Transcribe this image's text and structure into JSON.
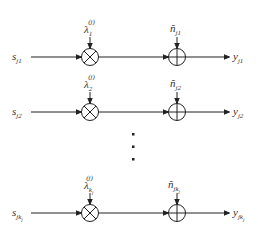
{
  "diagram": {
    "type": "signal-flow block diagram",
    "colors": {
      "stroke": "#222222",
      "text": "#333333",
      "background": "#ffffff"
    },
    "rows": [
      {
        "input": {
          "base": "s",
          "sub": "j1"
        },
        "gain": {
          "base": "λ",
          "sub": "1",
          "sup": "(j)"
        },
        "noise": {
          "base": "ñ",
          "sub": "j1"
        },
        "output": {
          "base": "y",
          "sub": "j1"
        },
        "multiplier_symbol": "⊗",
        "adder_symbol": "⊕"
      },
      {
        "input": {
          "base": "s",
          "sub": "j2"
        },
        "gain": {
          "base": "λ",
          "sub": "2",
          "sup": "(j)"
        },
        "noise": {
          "base": "ñ",
          "sub": "j2"
        },
        "output": {
          "base": "y",
          "sub": "j2"
        },
        "multiplier_symbol": "⊗",
        "adder_symbol": "⊕"
      },
      {
        "input": {
          "base": "s",
          "sub": "jk",
          "sub2": "j"
        },
        "gain": {
          "base": "λ",
          "sub": "k",
          "sub2": "j",
          "sup": "(j)"
        },
        "noise": {
          "base": "ñ",
          "sub": "jk",
          "sub2": "j"
        },
        "output": {
          "base": "y",
          "sub": "jk",
          "sub2": "j"
        },
        "multiplier_symbol": "⊗",
        "adder_symbol": "⊕"
      }
    ],
    "ellipsis": "⋮"
  }
}
